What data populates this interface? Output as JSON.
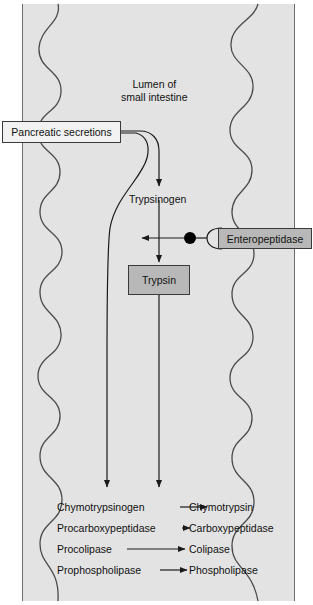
{
  "diagram": {
    "lumen_label_line1": "Lumen of",
    "lumen_label_line2": "small intestine",
    "pancreatic_secretions": "Pancreatic secretions",
    "trypsinogen": "Trypsinogen",
    "trypsin": "Trypsin",
    "enteropeptidase": "Enteropeptidase",
    "colors": {
      "lumen_fill": "#e3e3e3",
      "wall_line": "#4a4a4a",
      "box_gray_fill": "#b8b8b8",
      "box_white_fill": "#f2f2f2",
      "box_border": "#3a3a3a",
      "arrow": "#1a1a1a",
      "catalyst_dot": "#000000"
    },
    "reactions": [
      {
        "substrate": "Chymotrypsinogen",
        "product": "Chymotrypsin"
      },
      {
        "substrate": "Procarboxypeptidase",
        "product": "Carboxypeptidase"
      },
      {
        "substrate": "Procolipase",
        "product": "Colipase"
      },
      {
        "substrate": "Prophospholipase",
        "product": "Phospholipase"
      }
    ]
  }
}
